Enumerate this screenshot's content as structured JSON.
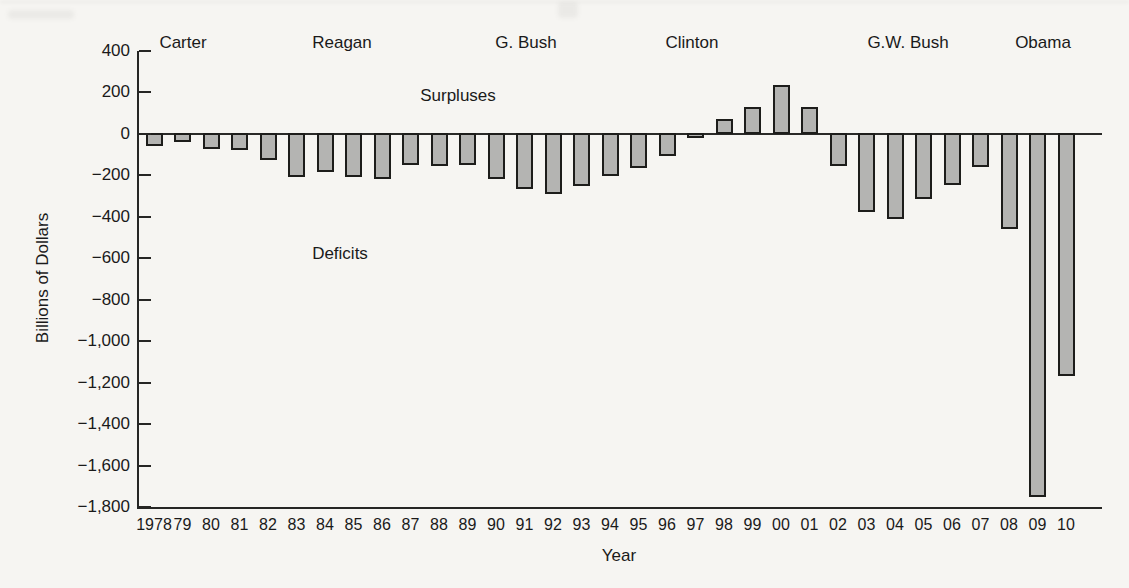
{
  "chart_data": {
    "type": "bar",
    "title": "",
    "xlabel": "Year",
    "ylabel": "Billions of Dollars",
    "x": [
      "1978",
      "79",
      "80",
      "81",
      "82",
      "83",
      "84",
      "85",
      "86",
      "87",
      "88",
      "89",
      "90",
      "91",
      "92",
      "93",
      "94",
      "95",
      "96",
      "97",
      "98",
      "99",
      "00",
      "01",
      "02",
      "03",
      "04",
      "05",
      "06",
      "07",
      "08",
      "09",
      "10"
    ],
    "values": [
      -59,
      -41,
      -74,
      -79,
      -128,
      -208,
      -185,
      -212,
      -221,
      -150,
      -155,
      -153,
      -221,
      -269,
      -290,
      -255,
      -203,
      -164,
      -107,
      -22,
      69,
      126,
      236,
      128,
      -158,
      -378,
      -413,
      -318,
      -248,
      -161,
      -459,
      -1752,
      -1171
    ],
    "ylim": [
      -1800,
      400
    ],
    "ytick_step": 200,
    "ytick_labels": [
      "400",
      "200",
      "0",
      "−200",
      "−400",
      "−600",
      "−800",
      "−1,000",
      "−1,200",
      "−1,400",
      "−1,600",
      "−1,800"
    ],
    "grid": false,
    "legend": "none",
    "bar_color": "#b4b4b2",
    "bar_border_color": "#1d1d1b",
    "annotations": [
      {
        "text": "Surpluses"
      },
      {
        "text": "Deficits"
      }
    ],
    "era_labels": [
      "Carter",
      "Reagan",
      "G. Bush",
      "Clinton",
      "G.W. Bush",
      "Obama"
    ]
  }
}
